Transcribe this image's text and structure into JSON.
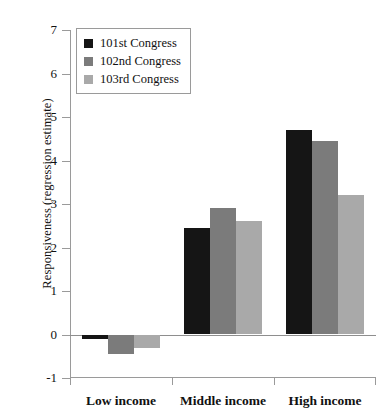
{
  "chart_data": {
    "type": "bar",
    "title": "",
    "xlabel": "",
    "ylabel": "Responsiveness (regression estimate)",
    "categories": [
      "Low income",
      "Middle income",
      "High income"
    ],
    "series": [
      {
        "name": "101st Congress",
        "color": "#151515",
        "values": [
          -0.1,
          2.45,
          4.7
        ]
      },
      {
        "name": "102nd Congress",
        "color": "#7b7b7b",
        "values": [
          -0.45,
          2.9,
          4.45
        ]
      },
      {
        "name": "103rd Congress",
        "color": "#a9a9a9",
        "values": [
          -0.3,
          2.6,
          3.2
        ]
      }
    ],
    "ylim": [
      -1,
      7
    ],
    "yticks": [
      7,
      6,
      5,
      4,
      3,
      2,
      1,
      0,
      -1
    ],
    "ytick_labels": [
      "7",
      "6",
      "5",
      "4",
      "3",
      "2",
      "1",
      "0",
      "-1"
    ],
    "grid": false,
    "legend_position": "top-left",
    "legend_entries": [
      "101st Congress",
      "102nd Congress",
      "103rd Congress"
    ]
  }
}
